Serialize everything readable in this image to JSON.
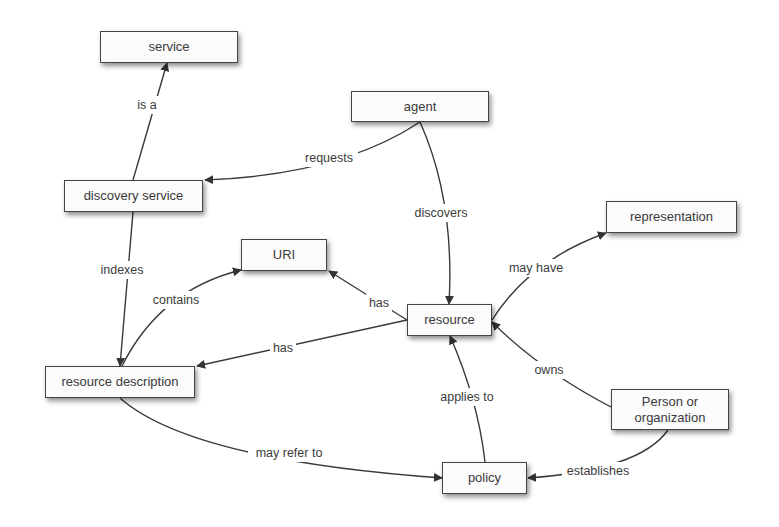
{
  "diagram": {
    "type": "concept-map",
    "colors": {
      "background": "#ffffff",
      "node_fill": "#fbfbfb",
      "node_border": "#444444",
      "edge": "#3a3a3a",
      "text": "#3a3a3a"
    },
    "nodes": [
      {
        "id": "service",
        "label": "service",
        "x": 100,
        "y": 31,
        "w": 138,
        "h": 32
      },
      {
        "id": "agent",
        "label": "agent",
        "x": 351,
        "y": 91,
        "w": 138,
        "h": 31
      },
      {
        "id": "discovery-service",
        "label": "discovery service",
        "x": 64,
        "y": 180,
        "w": 139,
        "h": 32
      },
      {
        "id": "representation",
        "label": "representation",
        "x": 606,
        "y": 201,
        "w": 131,
        "h": 32
      },
      {
        "id": "uri",
        "label": "URI",
        "x": 241,
        "y": 239,
        "w": 86,
        "h": 32
      },
      {
        "id": "resource",
        "label": "resource",
        "x": 407,
        "y": 304,
        "w": 85,
        "h": 32
      },
      {
        "id": "resource-description",
        "label": "resource description",
        "x": 45,
        "y": 366,
        "w": 150,
        "h": 32
      },
      {
        "id": "person-or-organization",
        "label": "Person or\norganization",
        "x": 611,
        "y": 389,
        "w": 118,
        "h": 41
      },
      {
        "id": "policy",
        "label": "policy",
        "x": 442,
        "y": 462,
        "w": 85,
        "h": 32
      }
    ],
    "edges": [
      {
        "from": "discovery-service",
        "to": "service",
        "label": "is a",
        "path": "M133,180 L167,63",
        "label_x": 147,
        "label_y": 105,
        "label_w": 30
      },
      {
        "from": "agent",
        "to": "discovery-service",
        "label": "requests",
        "path": "M420,122 Q340,175 205,180",
        "label_x": 329,
        "label_y": 158,
        "label_w": 58
      },
      {
        "from": "agent",
        "to": "resource",
        "label": "discovers",
        "path": "M420,122 Q455,200 449,304",
        "label_x": 441,
        "label_y": 213,
        "label_w": 62
      },
      {
        "from": "discovery-service",
        "to": "resource-description",
        "label": "indexes",
        "path": "M133,212 L120,366",
        "label_x": 122,
        "label_y": 270,
        "label_w": 52
      },
      {
        "from": "resource-description",
        "to": "uri",
        "label": "contains",
        "path": "M122,366 Q160,290 241,270",
        "label_x": 176,
        "label_y": 300,
        "label_w": 56
      },
      {
        "from": "resource",
        "to": "uri",
        "label": "has",
        "path": "M407,320 L329,271",
        "label_x": 379,
        "label_y": 303,
        "label_w": 26
      },
      {
        "from": "resource",
        "to": "resource-description",
        "label": "has",
        "path": "M407,320 L197,366",
        "label_x": 283,
        "label_y": 348,
        "label_w": 26
      },
      {
        "from": "resource",
        "to": "representation",
        "label": "may have",
        "path": "M492,320 Q530,260 606,233",
        "label_x": 536,
        "label_y": 268,
        "label_w": 62
      },
      {
        "from": "person-or-organization",
        "to": "resource",
        "label": "owns",
        "path": "M611,407 Q540,370 492,322",
        "label_x": 549,
        "label_y": 370,
        "label_w": 36
      },
      {
        "from": "policy",
        "to": "resource",
        "label": "applies to",
        "path": "M485,462 Q478,400 450,336",
        "label_x": 467,
        "label_y": 397,
        "label_w": 66
      },
      {
        "from": "resource-description",
        "to": "policy",
        "label": "may refer to",
        "path": "M120,398 Q190,460 442,478",
        "label_x": 289,
        "label_y": 453,
        "label_w": 82
      },
      {
        "from": "person-or-organization",
        "to": "policy",
        "label": "establishes",
        "path": "M668,430 Q640,470 528,478",
        "label_x": 598,
        "label_y": 471,
        "label_w": 72
      }
    ]
  }
}
